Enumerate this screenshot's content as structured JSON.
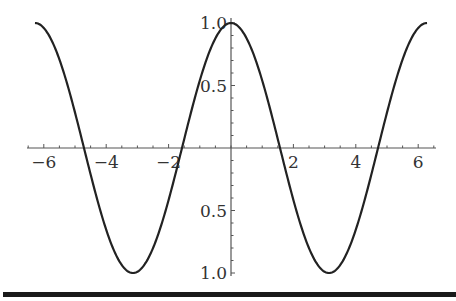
{
  "chart_data": {
    "type": "line",
    "title": "",
    "xlabel": "",
    "ylabel": "",
    "function": "cos(x)",
    "series": [
      {
        "name": "cos(x)",
        "x_range": [
          -6.283,
          6.283
        ],
        "color": "#222222"
      }
    ],
    "xlim": [
      -6.6,
      6.6
    ],
    "ylim": [
      -1.0,
      1.0
    ],
    "x_ticks": [
      -6,
      -4,
      -2,
      2,
      4,
      6
    ],
    "x_tick_labels": [
      "−6",
      "−4",
      "−2",
      "2",
      "4",
      "6"
    ],
    "y_ticks": [
      1.0,
      0.5,
      -0.5,
      -1.0
    ],
    "y_tick_labels": [
      "1.0",
      "0.5",
      "0.5",
      "1.0"
    ],
    "grid": false,
    "legend": "none",
    "axes_style": "centered at origin"
  },
  "colors": {
    "curve": "#222222",
    "axis": "#555555",
    "rule": "#1a1a1a"
  }
}
